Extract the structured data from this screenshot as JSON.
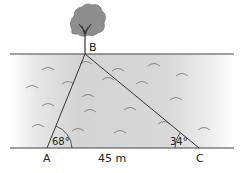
{
  "diagram": {
    "points": {
      "A": "A",
      "B": "B",
      "C": "C"
    },
    "angles": {
      "A": "68°",
      "C": "34°"
    },
    "distance_AC": "45 m",
    "colors": {
      "water": "#cfcfcf",
      "line": "#333333",
      "tree_foliage": "#8e8e8e",
      "tree_trunk": "#3a3a3a"
    }
  }
}
